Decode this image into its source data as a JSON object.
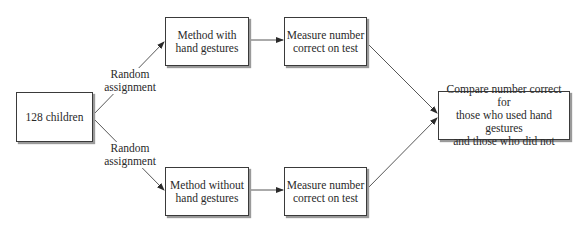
{
  "diagram": {
    "type": "flowchart",
    "nodes": {
      "start": {
        "text": "128 children"
      },
      "method_with": {
        "line1": "Method with",
        "line2": "hand gestures"
      },
      "measure_top": {
        "line1": "Measure number",
        "line2": "correct on test"
      },
      "method_without": {
        "line1": "Method without",
        "line2": "hand gestures"
      },
      "measure_bottom": {
        "line1": "Measure number",
        "line2": "correct on test"
      },
      "compare": {
        "line1": "Compare number correct for",
        "line2": "those who used hand gestures",
        "line3": "and those who did not"
      }
    },
    "edge_labels": {
      "upper": {
        "line1": "Random",
        "line2": "assignment"
      },
      "lower": {
        "line1": "Random",
        "line2": "assignment"
      }
    },
    "edges": [
      {
        "from": "start",
        "to": "method_with",
        "label": "Random assignment"
      },
      {
        "from": "start",
        "to": "method_without",
        "label": "Random assignment"
      },
      {
        "from": "method_with",
        "to": "measure_top"
      },
      {
        "from": "method_without",
        "to": "measure_bottom"
      },
      {
        "from": "measure_top",
        "to": "compare"
      },
      {
        "from": "measure_bottom",
        "to": "compare"
      }
    ]
  }
}
